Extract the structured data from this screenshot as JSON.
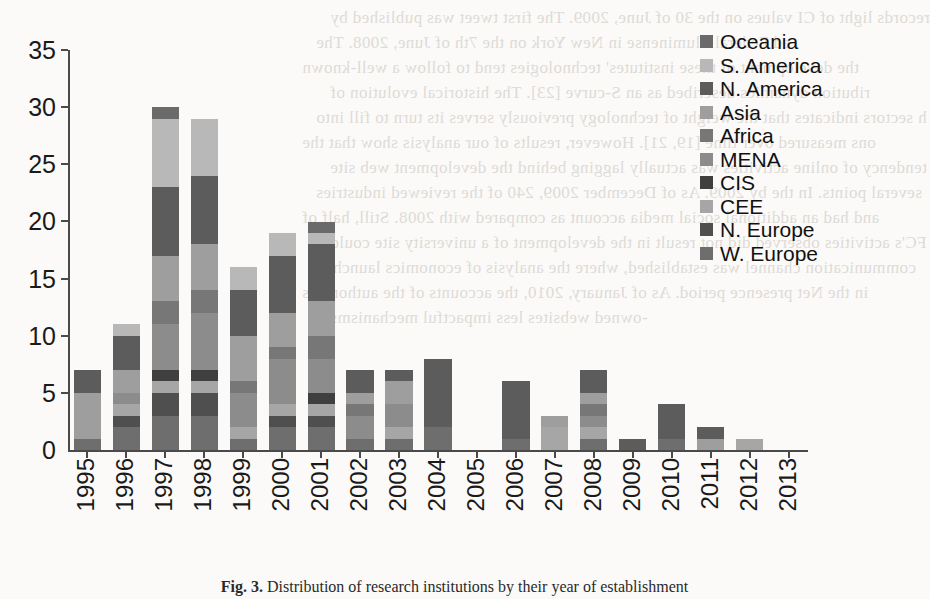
{
  "chart_data": {
    "type": "bar",
    "title": "",
    "xlabel": "",
    "ylabel": "",
    "ylim": [
      0,
      35
    ],
    "ytick_labels": [
      "0",
      "5",
      "10",
      "15",
      "20",
      "25",
      "30",
      "35"
    ],
    "ytick_values": [
      0,
      5,
      10,
      15,
      20,
      25,
      30,
      35
    ],
    "grid": false,
    "stacked": true,
    "legend_position": "right",
    "categories": [
      "1995",
      "1996",
      "1997",
      "1998",
      "1999",
      "2000",
      "2001",
      "2002",
      "2003",
      "2004",
      "2005",
      "2006",
      "2007",
      "2008",
      "2009",
      "2010",
      "2011",
      "2012",
      "2013"
    ],
    "series": [
      {
        "name": "W. Europe",
        "color": "#6e6e6e",
        "values": [
          1,
          2,
          3,
          3,
          1,
          2,
          2,
          1,
          1,
          2,
          0,
          1,
          0,
          1,
          0,
          1,
          0,
          0,
          0
        ]
      },
      {
        "name": "N. Europe",
        "color": "#4f4f4f",
        "values": [
          0,
          1,
          2,
          2,
          0,
          1,
          1,
          0,
          0,
          0,
          0,
          0,
          0,
          0,
          0,
          0,
          0,
          0,
          0
        ]
      },
      {
        "name": "CEE",
        "color": "#a6a6a6",
        "values": [
          0,
          1,
          1,
          1,
          1,
          1,
          1,
          0,
          1,
          0,
          0,
          0,
          2,
          1,
          0,
          0,
          0,
          1,
          0
        ]
      },
      {
        "name": "CIS",
        "color": "#3f3f3f",
        "values": [
          0,
          0,
          1,
          1,
          0,
          0,
          1,
          0,
          0,
          0,
          0,
          0,
          0,
          0,
          0,
          0,
          0,
          0,
          0
        ]
      },
      {
        "name": "MENA",
        "color": "#8c8c8c",
        "values": [
          0,
          1,
          4,
          5,
          3,
          4,
          3,
          2,
          2,
          0,
          0,
          0,
          0,
          1,
          0,
          0,
          0,
          0,
          0
        ]
      },
      {
        "name": "Africa",
        "color": "#777777",
        "values": [
          0,
          0,
          2,
          2,
          1,
          1,
          2,
          1,
          0,
          0,
          0,
          0,
          0,
          1,
          0,
          0,
          0,
          0,
          0
        ]
      },
      {
        "name": "Asia",
        "color": "#9e9e9e",
        "values": [
          4,
          2,
          4,
          4,
          4,
          3,
          3,
          1,
          2,
          0,
          0,
          0,
          1,
          1,
          0,
          0,
          1,
          0,
          0
        ]
      },
      {
        "name": "N. America",
        "color": "#5c5c5c",
        "values": [
          2,
          3,
          6,
          6,
          4,
          5,
          5,
          2,
          1,
          6,
          0,
          5,
          0,
          2,
          1,
          3,
          1,
          0,
          0
        ]
      },
      {
        "name": "S. America",
        "color": "#b8b8b8",
        "values": [
          0,
          1,
          6,
          5,
          2,
          2,
          1,
          0,
          0,
          0,
          0,
          0,
          0,
          0,
          0,
          0,
          0,
          0,
          0
        ]
      },
      {
        "name": "Oceania",
        "color": "#6a6a6a",
        "values": [
          0,
          0,
          1,
          0,
          0,
          0,
          1,
          0,
          0,
          0,
          0,
          0,
          0,
          0,
          0,
          0,
          0,
          0,
          0
        ]
      }
    ],
    "totals": [
      7,
      11,
      30,
      29,
      16,
      19,
      20,
      7,
      7,
      8,
      0,
      6,
      3,
      7,
      1,
      4,
      2,
      1,
      0
    ]
  },
  "legend": {
    "items": [
      {
        "label": "Oceania",
        "color": "#6a6a6a"
      },
      {
        "label": "S. America",
        "color": "#b8b8b8"
      },
      {
        "label": "N. America",
        "color": "#5c5c5c"
      },
      {
        "label": "Asia",
        "color": "#9e9e9e"
      },
      {
        "label": "Africa",
        "color": "#777777"
      },
      {
        "label": "MENA",
        "color": "#8c8c8c"
      },
      {
        "label": "CIS",
        "color": "#3f3f3f"
      },
      {
        "label": "CEE",
        "color": "#a6a6a6"
      },
      {
        "label": "N. Europe",
        "color": "#4f4f4f"
      },
      {
        "label": "W. Europe",
        "color": "#6e6e6e"
      }
    ]
  },
  "caption": {
    "figure_number": "Fig. 3.",
    "text": "Distribution of research institutions by their year of establishment"
  },
  "background_text": {
    "lines": [
      "records light of CI values on the 30 of June, 2009. The first tweet was published by",
      "ed Federal Fluminense in New York on the 7th of June, 2008. The",
      "the development of these institutes' technologies tend to follow a well-known",
      "ribution dynamics described as an S-curve [23]. The historical evolution of",
      "h sectors indicates that the weight of technology previously serves its turn to fill into",
      "ons measured over time [19, 21]. However, results of our analysis show that the",
      "tendency of online activities was actually lagging behind the development web site",
      "several points. In the by 2009. As of December 2009, 240 of the reviewed industries",
      "and had an additional social media account as compared with 2008. Still, half of",
      "FC's activities observed did not result in the development of a university site could",
      "communication channel was established, where the analysis of economics launched",
      "in the Net presence period. As of January, 2010, the accounts of the authorities",
      "-owned websites less impactful mechanisms"
    ]
  }
}
